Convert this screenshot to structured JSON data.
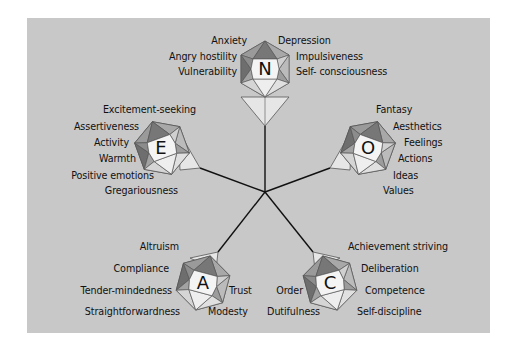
{
  "diagram": {
    "title": "",
    "background_color": "#c8c8c8",
    "center": {
      "x": 265,
      "y": 192
    },
    "factors": [
      {
        "letter": "N",
        "center": {
          "x": 265,
          "y": 69
        },
        "facets_left": [
          "Anxiety",
          "Angry hostility",
          "Vulnerability"
        ],
        "facets_right": [
          "Depression",
          "Impulsiveness",
          "Self- consciousness"
        ]
      },
      {
        "letter": "E",
        "center": {
          "x": 160,
          "y": 148
        },
        "facets_left": [
          "Excitement-seeking",
          "Assertiveness",
          "Activity",
          "Warmth",
          "Positive emotions",
          "Gregariousness"
        ]
      },
      {
        "letter": "O",
        "center": {
          "x": 368,
          "y": 148
        },
        "facets_right": [
          "Fantasy",
          "Aesthetics",
          "Feelings",
          "Actions",
          "Ideas",
          "Values"
        ]
      },
      {
        "letter": "A",
        "center": {
          "x": 203,
          "y": 283
        },
        "facets_left": [
          "Altruism",
          "Compliance",
          "Tender-mindedness",
          "Straightforwardness"
        ],
        "facets_right": [
          "Trust",
          "Modesty"
        ]
      },
      {
        "letter": "C",
        "center": {
          "x": 330,
          "y": 283
        },
        "facets_left": [
          "Order",
          "Dutifulness"
        ],
        "facets_right": [
          "Achievement striving",
          "Deliberation",
          "Competence",
          "Self-discipline"
        ]
      }
    ]
  }
}
